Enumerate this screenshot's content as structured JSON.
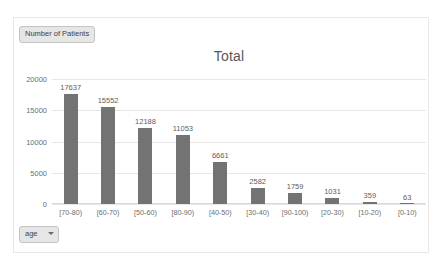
{
  "frame": {
    "background": "#ffffff",
    "border_color": "#e8e8e8"
  },
  "legend_field_button": {
    "label": "Number of Patients",
    "icon": "none"
  },
  "axis_field_button": {
    "label": "age",
    "icon": "chevron-down-icon"
  },
  "colors": {
    "bar": "#737373",
    "gridline": "#e7e7e7",
    "axis_text": "#6d6d6d",
    "title_text": "#595959",
    "data_label_text": "#5e5e5e",
    "field_button_bg": "#e6e6e6",
    "field_button_border": "#c4c4c4"
  },
  "chart_data": {
    "type": "bar",
    "title": "Total",
    "xlabel": "age",
    "ylabel": "Number of Patients",
    "categories": [
      "[70-80)",
      "[60-70)",
      "[50-60)",
      "[80-90)",
      "[40-50)",
      "[30-40)",
      "[90-100)",
      "[20-30)",
      "[10-20)",
      "[0-10)"
    ],
    "values": [
      17637,
      15552,
      12188,
      11053,
      6661,
      2582,
      1759,
      1031,
      359,
      63
    ],
    "data_labels": [
      "17637",
      "15552",
      "12188",
      "11053",
      "6661",
      "2582",
      "1759",
      "1031",
      "359",
      "63"
    ],
    "ylim": [
      0,
      20000
    ],
    "yticks": [
      0,
      5000,
      10000,
      15000,
      20000
    ],
    "ytick_labels": [
      "0",
      "5000",
      "10000",
      "15000",
      "20000"
    ],
    "grid": true,
    "legend": false,
    "legend_position": "none",
    "series": [
      {
        "name": "Number of Patients",
        "values": [
          17637,
          15552,
          12188,
          11053,
          6661,
          2582,
          1759,
          1031,
          359,
          63
        ]
      }
    ]
  }
}
